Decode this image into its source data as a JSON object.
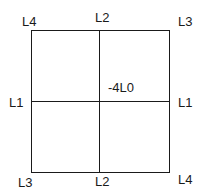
{
  "diagram": {
    "title": "",
    "labels": {
      "top_left": "L4",
      "top_center": "L2",
      "top_right": "L3",
      "middle_left": "L1",
      "center": "-4L0",
      "middle_right": "L1",
      "bottom_left": "L3",
      "bottom_center": "L2",
      "bottom_right": "L4"
    },
    "line_color": "#1a1a1a"
  }
}
